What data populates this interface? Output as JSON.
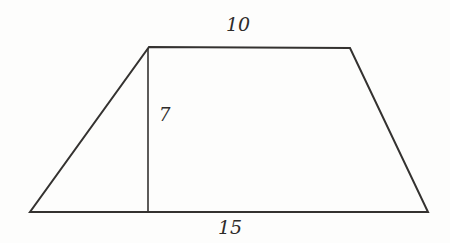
{
  "figure": {
    "type": "trapezoid-with-height",
    "labels": {
      "top_base": "10",
      "height": "7",
      "bottom_base": "15"
    },
    "geometry": {
      "trapezoid_points": "149,47 350,48 428,212 30,212",
      "height_path": "M 148 48 L 148 212"
    },
    "colors": {
      "stroke": "#343230",
      "label_text": "#2e2c2a",
      "background": "#fdfdfc"
    }
  }
}
